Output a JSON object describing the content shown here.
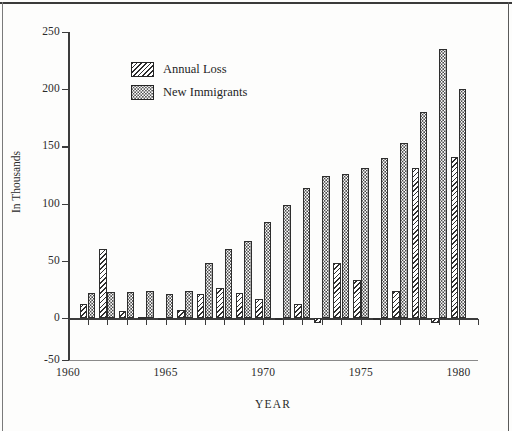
{
  "chart_data": {
    "type": "bar",
    "title": "",
    "xlabel": "YEAR",
    "ylabel": "In Thousands",
    "ylim": [
      -50,
      250
    ],
    "yticks": [
      -50,
      0,
      50,
      100,
      150,
      200,
      250
    ],
    "ytick_labels": [
      "-50",
      "0",
      "50",
      "100",
      "150",
      "200",
      "250"
    ],
    "xlim": [
      1960,
      1981
    ],
    "xticks": [
      1960,
      1965,
      1970,
      1975,
      1980
    ],
    "xtick_labels": [
      "1960",
      "1965",
      "1970",
      "1975",
      "1980"
    ],
    "grid": false,
    "legend_position": "upper-left-inside",
    "categories": [
      1961,
      1962,
      1963,
      1964,
      1965,
      1966,
      1967,
      1968,
      1969,
      1970,
      1971,
      1972,
      1973,
      1974,
      1975,
      1976,
      1977,
      1978,
      1979,
      1980
    ],
    "series": [
      {
        "name": "Annual Loss",
        "pattern": "diagonal-hatch",
        "values": [
          12,
          60,
          6,
          1,
          0,
          7,
          21,
          26,
          22,
          17,
          -2,
          12,
          -4,
          48,
          33,
          -1,
          24,
          131,
          -4,
          141
        ]
      },
      {
        "name": "New Immigrants",
        "pattern": "dotted",
        "values": [
          22,
          23,
          23,
          24,
          21,
          24,
          48,
          60,
          67,
          84,
          99,
          114,
          124,
          126,
          131,
          140,
          153,
          180,
          235,
          200
        ]
      }
    ]
  },
  "legend": {
    "items": [
      {
        "label": "Annual Loss",
        "swatch": "diagonal-hatch"
      },
      {
        "label": "New Immigrants",
        "swatch": "dotted"
      }
    ]
  }
}
